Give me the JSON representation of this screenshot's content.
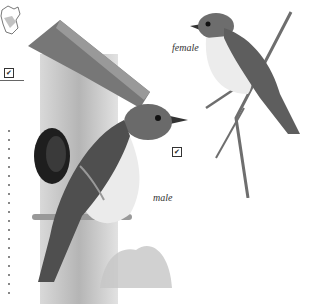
{
  "illustration": {
    "subject": "flycatcher pair with birdhouse",
    "labels": {
      "female": "female",
      "male": "male"
    },
    "checkboxes": {
      "map_checkbox": "✔",
      "male_checkbox": "✔"
    },
    "colors": {
      "background": "#ffffff",
      "wood": "#8a8a8a",
      "bird_back": "#5f5f5f",
      "bird_breast": "#e9e9e9",
      "branch": "#6e6e6e"
    }
  }
}
